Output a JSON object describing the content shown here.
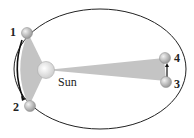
{
  "diagram": {
    "sun_label": "Sun",
    "points": [
      {
        "id": "1",
        "label": "1"
      },
      {
        "id": "2",
        "label": "2"
      },
      {
        "id": "3",
        "label": "3"
      },
      {
        "id": "4",
        "label": "4"
      }
    ],
    "colors": {
      "orbit": "#222222",
      "swept_area": "#c8c8c8",
      "planet": "#bdbdbd",
      "sun": "#e6e6e6"
    }
  }
}
